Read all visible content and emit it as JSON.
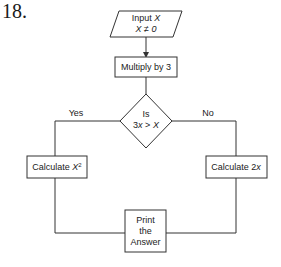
{
  "question_number": "18.",
  "flowchart": {
    "input": {
      "line1_prefix": "Input ",
      "line1_var": "X",
      "line2": "X ≠ 0"
    },
    "process1": {
      "label": "Multiply by 3"
    },
    "decision": {
      "line1": "Is",
      "line2_a": "3",
      "line2_b": "x",
      "line2_c": " > ",
      "line2_d": "X"
    },
    "branch_yes": {
      "label": "Yes"
    },
    "branch_no": {
      "label": "No"
    },
    "yes_process": {
      "prefix": "Calculate ",
      "var": "X",
      "sup": "2"
    },
    "no_process": {
      "prefix": "Calculate 2",
      "var": "x"
    },
    "output": {
      "line1": "Print",
      "line2": "the",
      "line3": "Answer"
    }
  }
}
